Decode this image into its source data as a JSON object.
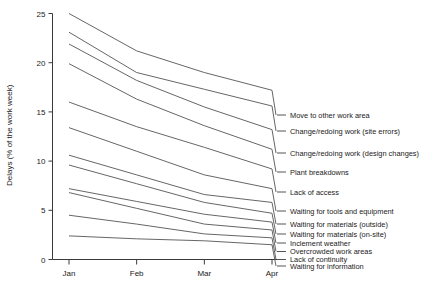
{
  "chart_data": {
    "type": "line",
    "title": "",
    "subtitle": "",
    "xlabel": "",
    "ylabel": "Delays (% of the work week)",
    "x": [
      "Jan",
      "Feb",
      "Mar",
      "Apr"
    ],
    "categories": [
      "Jan",
      "Feb",
      "Mar",
      "Apr"
    ],
    "xtick_labels": [
      "Jan",
      "Feb",
      "Mar",
      "Apr"
    ],
    "ytick_labels": [
      "0",
      "5",
      "10",
      "15",
      "20",
      "25"
    ],
    "yticks": [
      0,
      5,
      10,
      15,
      20,
      25
    ],
    "ylim": [
      0,
      25
    ],
    "grid": false,
    "legend_position": "right-inline-labels",
    "series": [
      {
        "name": "Move to other work area",
        "values": [
          25.0,
          21.2,
          19.0,
          17.2
        ]
      },
      {
        "name": "Change/redoing work (site errors)",
        "values": [
          23.1,
          19.0,
          17.3,
          15.6
        ]
      },
      {
        "name": "Change/redoing work (design  changes)",
        "values": [
          21.9,
          18.2,
          15.5,
          13.2
        ]
      },
      {
        "name": "Plant breakdowns",
        "values": [
          19.9,
          16.3,
          13.6,
          11.2
        ]
      },
      {
        "name": "Lack of access",
        "values": [
          16.0,
          13.5,
          11.4,
          9.2
        ]
      },
      {
        "name": "Waiting for tools and equipment",
        "values": [
          13.4,
          11.0,
          8.6,
          7.2
        ]
      },
      {
        "name": "Waiting for materials (outside)",
        "values": [
          10.6,
          8.6,
          6.6,
          5.8
        ]
      },
      {
        "name": "Waiting for materials (on-site)",
        "values": [
          9.6,
          7.7,
          5.8,
          4.7
        ]
      },
      {
        "name": "Inclement weather",
        "values": [
          7.2,
          5.9,
          4.6,
          3.8
        ]
      },
      {
        "name": "Overcrowded work areas",
        "values": [
          6.8,
          5.2,
          3.6,
          3.0
        ]
      },
      {
        "name": "Lack of continuity",
        "values": [
          4.5,
          3.6,
          2.6,
          2.2
        ]
      },
      {
        "name": "Waiting for information",
        "values": [
          2.4,
          2.1,
          1.9,
          1.5
        ]
      }
    ]
  },
  "legend": {
    "items": [
      {
        "label": "Move to other work area"
      },
      {
        "label": "Change/redoing work (site errors)"
      },
      {
        "label": "Change/redoing work (design  changes)"
      },
      {
        "label": "Plant breakdowns"
      },
      {
        "label": "Lack of access"
      },
      {
        "label": "Waiting for tools and equipment"
      },
      {
        "label": "Waiting for materials (outside)"
      },
      {
        "label": "Waiting for materials (on-site)"
      },
      {
        "label": "Inclement weather"
      },
      {
        "label": "Overcrowded work areas"
      },
      {
        "label": "Lack of continuity"
      },
      {
        "label": "Waiting for information"
      }
    ]
  },
  "axes": {
    "y_title": "Delays (% of the work week)",
    "y_ticks": [
      "25",
      "20",
      "15",
      "10",
      "5",
      "0"
    ],
    "x_ticks": [
      "Jan",
      "Feb",
      "Mar",
      "Apr"
    ]
  },
  "colors": {
    "line": "#555555",
    "axis": "#3a3a3a",
    "text": "#1a1a1a",
    "background": "#ffffff"
  }
}
